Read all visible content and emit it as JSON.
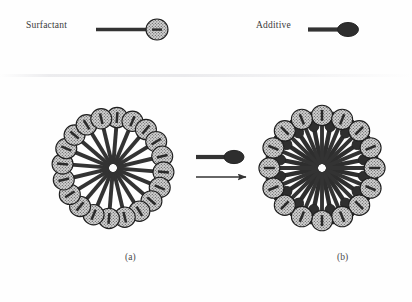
{
  "figure": {
    "type": "schematic-diagram",
    "background_color": "#fefefe"
  },
  "legend": {
    "surfactant": {
      "label": "Surfactant",
      "symbol": "surfactant-symbol",
      "head_shape": "circle",
      "head_fill": "stippled-light",
      "head_color": "#b9b9b9",
      "tail_color": "#333333"
    },
    "additive": {
      "label": "Additive",
      "symbol": "additive-symbol",
      "head_shape": "ellipse",
      "head_fill": "solid-dark",
      "head_color": "#2e2e2e",
      "tail_color": "#333333"
    }
  },
  "arrow": {
    "direction": "right",
    "label": "",
    "reagent_symbol": "additive-symbol"
  },
  "panels": [
    {
      "id": "a",
      "label": "(a)",
      "name": "micelle-plain",
      "center_x": 113,
      "center_y": 168,
      "surfactant_count": 20,
      "additive_count": 0,
      "core_radius": 4,
      "tail_length": 42,
      "head_radius": 10.5
    },
    {
      "id": "b",
      "label": "(b)",
      "name": "micelle-mixed",
      "center_x": 322,
      "center_y": 168,
      "surfactant_count": 16,
      "additive_count": 16,
      "core_radius": 4,
      "tail_length": 44,
      "head_radius": 10.5
    }
  ],
  "colors": {
    "tail": "#333333",
    "outline": "#1e1e1e",
    "head_light": "#c2c2c2",
    "head_dark": "#2e2e2e",
    "text": "#3a3a3a"
  }
}
